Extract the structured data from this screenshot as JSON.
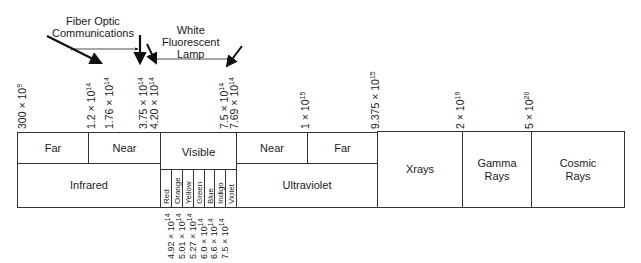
{
  "annotations": {
    "fiber_optic": [
      "Fiber Optic",
      "Communications"
    ],
    "fluorescent": [
      "White",
      "Fluorescent",
      "Lamp"
    ]
  },
  "top_ticks": [
    {
      "mantissa": "300 × 10",
      "exp": "9"
    },
    {
      "mantissa": "1.2 × 10",
      "exp": "14"
    },
    {
      "mantissa": "1.76 × 10",
      "exp": "14"
    },
    {
      "mantissa": "3.75 × 10",
      "exp": "14"
    },
    {
      "mantissa": "4.20 × 10",
      "exp": "14"
    },
    {
      "mantissa": "7.5 × 10",
      "exp": "14"
    },
    {
      "mantissa": "7.69 × 10",
      "exp": "14"
    },
    {
      "mantissa": "1 × 10",
      "exp": "15"
    },
    {
      "mantissa": "9.375 × 10",
      "exp": "15"
    },
    {
      "mantissa": "2 × 10",
      "exp": "19"
    },
    {
      "mantissa": "5 × 10",
      "exp": "20"
    }
  ],
  "bottom_ticks": [
    {
      "mantissa": "4.92 × 10",
      "exp": "14"
    },
    {
      "mantissa": "5.01 × 10",
      "exp": "14"
    },
    {
      "mantissa": "5.27 × 10",
      "exp": "14"
    },
    {
      "mantissa": "6.0 × 10",
      "exp": "14"
    },
    {
      "mantissa": "6.6 × 10",
      "exp": "14"
    },
    {
      "mantissa": "7.5 × 10",
      "exp": "14"
    }
  ],
  "regions": {
    "infrared": {
      "label": "Infrared",
      "far": "Far",
      "near": "Near"
    },
    "visible": {
      "label": "Visible",
      "bands": [
        "Red",
        "Orange",
        "Yellow",
        "Green",
        "Blue",
        "Indigo",
        "Violet"
      ]
    },
    "ultraviolet": {
      "label": "Ultraviolet",
      "near": "Near",
      "far": "Far"
    },
    "xrays": {
      "label": "Xrays"
    },
    "gamma": {
      "label": [
        "Gamma",
        "Rays"
      ]
    },
    "cosmic": {
      "label": [
        "Cosmic",
        "Rays"
      ]
    }
  }
}
